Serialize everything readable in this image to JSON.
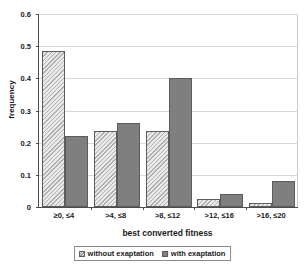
{
  "chart_data": {
    "type": "bar",
    "title": "",
    "xlabel": "best converted fitness",
    "ylabel": "frequency",
    "categories": [
      "≥0, ≤4",
      ">4, ≤8",
      ">8, ≤12",
      ">12, ≤16",
      ">16, ≤20"
    ],
    "series": [
      {
        "name": "without exaptation",
        "values": [
          0.485,
          0.235,
          0.235,
          0.025,
          0.012
        ],
        "style": "hatched",
        "color": "#e9e9e9"
      },
      {
        "name": "with exaptation",
        "values": [
          0.22,
          0.26,
          0.4,
          0.04,
          0.08
        ],
        "style": "solid",
        "color": "#7f7f7f"
      }
    ],
    "ylim": [
      0,
      0.6
    ],
    "ytick_labels": [
      "0",
      "0.1",
      "0.2",
      "0.3",
      "0.4",
      "0.5",
      "0.6"
    ],
    "ytick_values": [
      0,
      0.1,
      0.2,
      0.3,
      0.4,
      0.5,
      0.6
    ],
    "grid": true,
    "legend_position": "bottom"
  },
  "legend": {
    "entries": [
      {
        "label": "without exaptation"
      },
      {
        "label": "with exaptation"
      }
    ]
  }
}
